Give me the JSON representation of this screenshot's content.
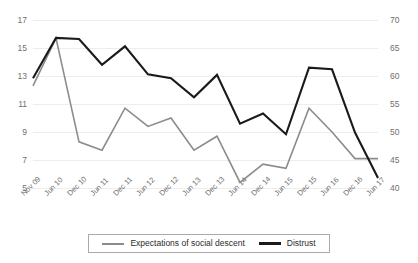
{
  "chart_data": {
    "type": "line",
    "title": "",
    "subtitle": "",
    "xlabel": "",
    "ylabel": "",
    "grid": true,
    "legend_position": "bottom",
    "categories": [
      "Nov 09",
      "Jun 10",
      "Dec 10",
      "Jun 11",
      "Dec 11",
      "Jun 12",
      "Dec 12",
      "Jun 13",
      "Dec 13",
      "Jun 14",
      "Dec 14",
      "Jun 15",
      "Dec 15",
      "Jun 16",
      "Dec 16",
      "Jun 17"
    ],
    "axes": {
      "left": {
        "label": "",
        "ylim": [
          5,
          17
        ],
        "ticks": [
          5,
          7,
          9,
          11,
          13,
          15,
          17
        ],
        "tick_labels": [
          "5",
          "7",
          "9",
          "11",
          "13",
          "15",
          "17"
        ]
      },
      "right": {
        "label": "",
        "ylim": [
          40,
          70
        ],
        "ticks": [
          40,
          45,
          50,
          55,
          60,
          65,
          70
        ],
        "tick_labels": [
          "40",
          "45",
          "50",
          "55",
          "60",
          "65",
          "70"
        ]
      }
    },
    "series": [
      {
        "name": "Expectations of social descent",
        "axis": "left",
        "color": "#8c8c8c",
        "width": 1.6,
        "values": [
          12.3,
          15.7,
          8.3,
          7.7,
          10.7,
          9.4,
          10.0,
          7.7,
          8.7,
          5.4,
          6.7,
          6.4,
          10.7,
          9.0,
          7.1,
          7.1
        ]
      },
      {
        "name": "Distrust",
        "axis": "right",
        "color": "#1a1a1a",
        "width": 2.1,
        "values": [
          59.6,
          66.8,
          66.6,
          62.0,
          65.3,
          60.3,
          59.6,
          56.2,
          60.2,
          51.5,
          53.3,
          49.6,
          61.5,
          61.2,
          49.9,
          41.8
        ]
      }
    ]
  },
  "legend": {
    "items": [
      {
        "label": "Expectations of social descent",
        "color": "#8c8c8c",
        "width": 2
      },
      {
        "label": "Distrust",
        "color": "#1a1a1a",
        "width": 3
      }
    ]
  }
}
